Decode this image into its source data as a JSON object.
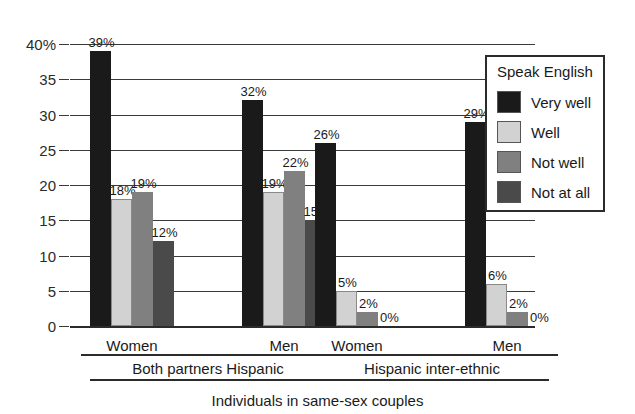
{
  "chart_data": {
    "type": "bar",
    "title": "",
    "xlabel": "Individuals in same-sex couples",
    "ylabel": "",
    "ylim": [
      0,
      40
    ],
    "grid": true,
    "legend_position": "top-right inside plot",
    "legend_title": "Speak English",
    "ytick_labels": [
      "40%",
      "35",
      "30",
      "25",
      "20",
      "15",
      "10",
      "5",
      "0"
    ],
    "ytick_values": [
      40,
      35,
      30,
      25,
      20,
      15,
      10,
      5,
      0
    ],
    "categories": [
      "Women",
      "Men",
      "Women",
      "Men"
    ],
    "supergroups": [
      {
        "label": "Both partners Hispanic",
        "categories": [
          "Women",
          "Men"
        ]
      },
      {
        "label": "Hispanic inter-ethnic",
        "categories": [
          "Women",
          "Men"
        ]
      }
    ],
    "series": [
      {
        "name": "Very well",
        "color": "#1a1a1a",
        "values": [
          39,
          32,
          26,
          29
        ],
        "labels": [
          "39%",
          "32%",
          "26%",
          "29%"
        ]
      },
      {
        "name": "Well",
        "color": "#d2d2d2",
        "values": [
          18,
          19,
          5,
          6
        ],
        "labels": [
          "18%",
          "19%",
          "5%",
          "6%"
        ]
      },
      {
        "name": "Not well",
        "color": "#808080",
        "values": [
          19,
          22,
          2,
          2
        ],
        "labels": [
          "19%",
          "22%",
          "2%",
          "2%"
        ]
      },
      {
        "name": "Not at all",
        "color": "#4a4a4a",
        "values": [
          12,
          15,
          0,
          0
        ],
        "labels": [
          "12%",
          "15%",
          "0%",
          "0%"
        ]
      }
    ]
  },
  "legend": {
    "title": "Speak English",
    "items": [
      {
        "label": "Very well",
        "color": "#1a1a1a"
      },
      {
        "label": "Well",
        "color": "#d2d2d2"
      },
      {
        "label": "Not well",
        "color": "#808080"
      },
      {
        "label": "Not at all",
        "color": "#4a4a4a"
      }
    ]
  }
}
